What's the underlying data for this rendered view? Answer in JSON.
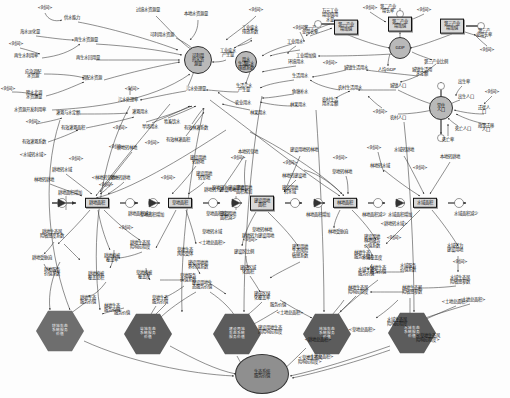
{
  "diagram": {
    "type": "system-dynamics-stock-flow",
    "colors": {
      "stock_fill": "#d8d8d8",
      "hex_fill": "#6e6e6e",
      "circle_fill": "#b9b9b9",
      "ellipse_fill": "#8f8f8f",
      "link": "#333333",
      "background": "#fdfdfd"
    }
  },
  "stocks": [
    {
      "id": "s1",
      "label": "可利用\n的水资\n源量",
      "shape": "circle",
      "x": 198,
      "y": 60,
      "w": 26,
      "h": 26
    },
    {
      "id": "s2",
      "label": "用水\n量",
      "shape": "circle",
      "x": 246,
      "y": 62,
      "w": 20,
      "h": 20
    },
    {
      "id": "s3",
      "label": "第一产业\n增加值",
      "shape": "box",
      "x": 346,
      "y": 27,
      "w": 34,
      "h": 15
    },
    {
      "id": "s4",
      "label": "第二产业\n增加值",
      "shape": "box",
      "x": 400,
      "y": 24,
      "w": 34,
      "h": 15
    },
    {
      "id": "s5",
      "label": "第三产业\n增加值",
      "shape": "box",
      "x": 452,
      "y": 26,
      "w": 34,
      "h": 15
    },
    {
      "id": "s6",
      "label": "GDP",
      "shape": "circle",
      "x": 400,
      "y": 48,
      "w": 20,
      "h": 20
    },
    {
      "id": "s7",
      "label": "常住\n人口",
      "shape": "circle",
      "x": 441,
      "y": 108,
      "w": 22,
      "h": 22
    },
    {
      "id": "s8",
      "label": "耕地面积",
      "shape": "box",
      "x": 97,
      "y": 203,
      "w": 40,
      "h": 13
    },
    {
      "id": "s9",
      "label": "草地面积",
      "shape": "box",
      "x": 180,
      "y": 203,
      "w": 40,
      "h": 13
    },
    {
      "id": "s10",
      "label": "建设用地\n面积",
      "shape": "box",
      "x": 262,
      "y": 203,
      "w": 40,
      "h": 15
    },
    {
      "id": "s11",
      "label": "林地面积",
      "shape": "box",
      "x": 345,
      "y": 203,
      "w": 40,
      "h": 13
    },
    {
      "id": "s12",
      "label": "水域面积",
      "shape": "box",
      "x": 425,
      "y": 203,
      "w": 40,
      "h": 13
    }
  ],
  "hex_nodes": [
    {
      "id": "h1",
      "label": "耕地生态\n系统服务\n价值",
      "x": 60,
      "y": 331,
      "w": 48,
      "h": 42
    },
    {
      "id": "h2",
      "label": "草地生态\n系统服务\n价值",
      "x": 148,
      "y": 334,
      "w": 48,
      "h": 42
    },
    {
      "id": "h3",
      "label": "建设用地\n生态系统\n服务价值",
      "x": 237,
      "y": 334,
      "w": 48,
      "h": 42
    },
    {
      "id": "h4",
      "label": "林地生态\n系统服务\n价值",
      "x": 327,
      "y": 334,
      "w": 48,
      "h": 42
    },
    {
      "id": "h5",
      "label": "水域生态\n系统服务\n价值",
      "x": 412,
      "y": 333,
      "w": 48,
      "h": 42
    }
  ],
  "outcome": {
    "id": "o1",
    "label": "生态系统\n服务价值",
    "x": 262,
    "y": 374,
    "w": 52,
    "h": 38
  },
  "aux_labels": [
    {
      "t": "<时间>",
      "x": 45,
      "y": 8
    },
    {
      "t": "供水能力",
      "x": 72,
      "y": 18
    },
    {
      "t": "海水淡化量",
      "x": 30,
      "y": 32
    },
    {
      "t": "<时间>",
      "x": 16,
      "y": 44
    },
    {
      "t": "再生水利用率",
      "x": 26,
      "y": 56
    },
    {
      "t": "再生水资源量",
      "x": 86,
      "y": 40
    },
    {
      "t": "再生水回用量",
      "x": 88,
      "y": 58
    },
    {
      "t": "应急调配\n水资源",
      "x": 33,
      "y": 74
    },
    {
      "t": "<时间>",
      "x": 8,
      "y": 89
    },
    {
      "t": "调配水资源",
      "x": 92,
      "y": 78
    },
    {
      "t": "跨水北调\n水资源量",
      "x": 34,
      "y": 95
    },
    {
      "t": "水资源开发利用率",
      "x": 30,
      "y": 110
    },
    {
      "t": "过境水资源量",
      "x": 148,
      "y": 10
    },
    {
      "t": "本地水资源量",
      "x": 196,
      "y": 14
    },
    {
      "t": "<时间>",
      "x": 256,
      "y": 10
    },
    {
      "t": "可利用水资源",
      "x": 162,
      "y": 35
    },
    {
      "t": "工业废水\n排放系数",
      "x": 250,
      "y": 30
    },
    {
      "t": "工业废水\n产生量",
      "x": 228,
      "y": 53
    },
    {
      "t": "生活污水\n排放系数",
      "x": 246,
      "y": 66
    },
    {
      "t": "生活污水\n产生量",
      "x": 244,
      "y": 88
    },
    {
      "t": "污水处理量",
      "x": 196,
      "y": 89
    },
    {
      "t": "污水处理率",
      "x": 128,
      "y": 100
    },
    {
      "t": "<时间>",
      "x": 132,
      "y": 89
    },
    {
      "t": "万元工业\n增加值用\n水量",
      "x": 330,
      "y": 16
    },
    {
      "t": "工业用水",
      "x": 295,
      "y": 42
    },
    {
      "t": "<时间>",
      "x": 300,
      "y": 28
    },
    {
      "t": "环境用水",
      "x": 296,
      "y": 62
    },
    {
      "t": "<时间>",
      "x": 330,
      "y": 63
    },
    {
      "t": "生活用水",
      "x": 300,
      "y": 76
    },
    {
      "t": "农业用水",
      "x": 243,
      "y": 103
    },
    {
      "t": "鱼塘补水",
      "x": 300,
      "y": 92
    },
    {
      "t": "林果用水",
      "x": 298,
      "y": 105
    },
    {
      "t": "城镇生活用\n水定额",
      "x": 422,
      "y": 72
    },
    {
      "t": "城镇生活用水",
      "x": 356,
      "y": 68
    },
    {
      "t": "农村生活用水",
      "x": 350,
      "y": 88
    },
    {
      "t": "农村生活\n用水定额",
      "x": 330,
      "y": 102
    },
    {
      "t": "<时间>",
      "x": 380,
      "y": 112
    },
    {
      "t": "城镇人口",
      "x": 398,
      "y": 86
    },
    {
      "t": "农村人口",
      "x": 398,
      "y": 118
    },
    {
      "t": "人均GDP",
      "x": 387,
      "y": 70
    },
    {
      "t": "第三产业比例",
      "x": 436,
      "y": 62
    },
    {
      "t": "出生率",
      "x": 464,
      "y": 82
    },
    {
      "t": "出生人口",
      "x": 466,
      "y": 97
    },
    {
      "t": "<时间>",
      "x": 492,
      "y": 92
    },
    {
      "t": "迁徙人\n口",
      "x": 484,
      "y": 110
    },
    {
      "t": "死亡人口",
      "x": 463,
      "y": 129
    },
    {
      "t": "死亡率",
      "x": 448,
      "y": 140
    },
    {
      "t": "政策迁移\n人口",
      "x": 486,
      "y": 128
    },
    {
      "t": "第一产\n业增长率",
      "x": 310,
      "y": 30
    },
    {
      "t": "第二产业\n增长率",
      "x": 388,
      "y": 9
    },
    {
      "t": "<时间>",
      "x": 424,
      "y": 10
    },
    {
      "t": "<时间>",
      "x": 370,
      "y": 8
    },
    {
      "t": "第三产\n业增长率",
      "x": 484,
      "y": 33
    },
    {
      "t": "<时间>",
      "x": 487,
      "y": 50
    },
    {
      "t": "工业增加值",
      "x": 306,
      "y": 56
    },
    {
      "t": "灌溉与水定额",
      "x": 68,
      "y": 113
    },
    {
      "t": "<时间>",
      "x": 33,
      "y": 122
    },
    {
      "t": "灌溉用水",
      "x": 140,
      "y": 112
    },
    {
      "t": "有效灌溉面积",
      "x": 73,
      "y": 128
    },
    {
      "t": "<时间>",
      "x": 120,
      "y": 128
    },
    {
      "t": "旱场用水",
      "x": 150,
      "y": 127
    },
    {
      "t": "有效灌溉系数",
      "x": 34,
      "y": 142
    },
    {
      "t": "<时间>",
      "x": 116,
      "y": 147
    },
    {
      "t": "牲畜饮水",
      "x": 172,
      "y": 122
    },
    {
      "t": "有效林灌系数",
      "x": 196,
      "y": 128
    },
    {
      "t": "有效林灌面积",
      "x": 178,
      "y": 140
    },
    {
      "t": "林果用水",
      "x": 258,
      "y": 113
    },
    {
      "t": "<水域转水域>",
      "x": 33,
      "y": 155
    },
    {
      "t": "耕地转林地",
      "x": 127,
      "y": 148
    },
    {
      "t": "<时间>",
      "x": 152,
      "y": 143
    },
    {
      "t": "耕地转水域",
      "x": 62,
      "y": 170
    },
    {
      "t": "<时间>",
      "x": 76,
      "y": 159
    },
    {
      "t": "本地转草地",
      "x": 248,
      "y": 152
    },
    {
      "t": "林地转耕地",
      "x": 44,
      "y": 180
    },
    {
      "t": "<林地转草地>",
      "x": 105,
      "y": 178
    },
    {
      "t": "建设用地\n转耕地",
      "x": 198,
      "y": 160
    },
    {
      "t": "<时间>",
      "x": 238,
      "y": 158
    },
    {
      "t": "<时间>",
      "x": 106,
      "y": 185
    },
    {
      "t": "草地转耕地",
      "x": 120,
      "y": 178
    },
    {
      "t": "<时间>",
      "x": 168,
      "y": 178
    },
    {
      "t": "建设用地\n转草地",
      "x": 204,
      "y": 176
    },
    {
      "t": "原地转为建设用地",
      "x": 228,
      "y": 188
    },
    {
      "t": "<时间>",
      "x": 290,
      "y": 163
    },
    {
      "t": "林地转建设地",
      "x": 294,
      "y": 176
    },
    {
      "t": "建设用地转林地",
      "x": 304,
      "y": 150
    },
    {
      "t": "<时间>",
      "x": 340,
      "y": 158
    },
    {
      "t": "草地转林地",
      "x": 342,
      "y": 172
    },
    {
      "t": "建设用地\n转水域",
      "x": 290,
      "y": 190
    },
    {
      "t": "<时间>",
      "x": 374,
      "y": 148
    },
    {
      "t": "林地转水域",
      "x": 380,
      "y": 166
    },
    {
      "t": "水域转耕地",
      "x": 404,
      "y": 150
    },
    {
      "t": "<时间>",
      "x": 420,
      "y": 168
    },
    {
      "t": "本地转耕地",
      "x": 450,
      "y": 157
    },
    {
      "t": "耕地面积增加",
      "x": 70,
      "y": 193
    },
    {
      "t": "耕地面积减少",
      "x": 140,
      "y": 214
    },
    {
      "t": "草地面积增加",
      "x": 152,
      "y": 215
    },
    {
      "t": "草地面积减少",
      "x": 218,
      "y": 214
    },
    {
      "t": "建设用地\n面积减少",
      "x": 228,
      "y": 216
    },
    {
      "t": "建设用地\n面积增加",
      "x": 244,
      "y": 190
    },
    {
      "t": "林地面积增加",
      "x": 318,
      "y": 215
    },
    {
      "t": "林地面积减少",
      "x": 374,
      "y": 215
    },
    {
      "t": "水域面积增加",
      "x": 400,
      "y": 215
    },
    {
      "t": "水域面积减少",
      "x": 466,
      "y": 214
    },
    {
      "t": "<耕地转水域>",
      "x": 394,
      "y": 224
    },
    {
      "t": "<时间>",
      "x": 126,
      "y": 228
    },
    {
      "t": "耕地转为建设用地",
      "x": 220,
      "y": 190
    },
    {
      "t": "耕地生态风\n险敏感度系数",
      "x": 52,
      "y": 234
    },
    {
      "t": "耕地转为建设用地",
      "x": 258,
      "y": 236
    },
    {
      "t": "耕地生态风\n险响应程度",
      "x": 140,
      "y": 245
    },
    {
      "t": "耕地受胁迫",
      "x": 42,
      "y": 258
    },
    {
      "t": "耕地植被\n覆盖率",
      "x": 112,
      "y": 258
    },
    {
      "t": "草地生态\n风险受体",
      "x": 185,
      "y": 252
    },
    {
      "t": "耕地服务\n价值系数",
      "x": 52,
      "y": 272
    },
    {
      "t": "耕地植被\n覆盖总积",
      "x": 96,
      "y": 276
    },
    {
      "t": "草地植被\n覆盖度",
      "x": 144,
      "y": 275
    },
    {
      "t": "草地服务\n价值系数",
      "x": 188,
      "y": 278
    },
    {
      "t": "耕地生态\n服务价值",
      "x": 88,
      "y": 300
    },
    {
      "t": "草地转水域",
      "x": 212,
      "y": 232
    },
    {
      "t": "草地转林地",
      "x": 262,
      "y": 230
    },
    {
      "t": "林地受胁迫",
      "x": 338,
      "y": 232
    },
    {
      "t": "<土地总面积>",
      "x": 212,
      "y": 243
    },
    {
      "t": "<时间>",
      "x": 250,
      "y": 240
    },
    {
      "t": "建设区比例",
      "x": 244,
      "y": 252
    },
    {
      "t": "建设用地\n生态风险\n敏感系数",
      "x": 300,
      "y": 252
    },
    {
      "t": "林地生态\n服务价值",
      "x": 362,
      "y": 255
    },
    {
      "t": "建设用地地\n界价值系数",
      "x": 198,
      "y": 265
    },
    {
      "t": "建成区域\n化面积",
      "x": 248,
      "y": 270
    },
    {
      "t": "林地生态\n服务价值",
      "x": 378,
      "y": 270
    },
    {
      "t": "建设用地生\n态服务价值",
      "x": 202,
      "y": 285
    },
    {
      "t": "草地生态\n服务价值",
      "x": 160,
      "y": 300
    },
    {
      "t": "建成区绿\n化覆盖率",
      "x": 262,
      "y": 296
    },
    {
      "t": "建设用地\n林地服务\n价值系数",
      "x": 372,
      "y": 242
    },
    {
      "t": "<时间>",
      "x": 394,
      "y": 238
    },
    {
      "t": "水域覆盖度",
      "x": 372,
      "y": 258
    },
    {
      "t": "水域生态\n服务价值",
      "x": 366,
      "y": 272
    },
    {
      "t": "水域服务\n价值系数",
      "x": 408,
      "y": 268
    },
    {
      "t": "水域转为\n建设用地",
      "x": 455,
      "y": 248
    },
    {
      "t": "<时间>",
      "x": 460,
      "y": 262
    },
    {
      "t": "水域生态风\n险敏感参数",
      "x": 460,
      "y": 280
    },
    {
      "t": "林地生态风\n险响应程度",
      "x": 358,
      "y": 290
    },
    {
      "t": "林地生态风\n险敏感参数",
      "x": 412,
      "y": 290
    },
    {
      "t": "<土地总面积>",
      "x": 472,
      "y": 300
    },
    {
      "t": "<土地总面积>",
      "x": 455,
      "y": 302
    },
    {
      "t": "林地生态\n服务价值",
      "x": 112,
      "y": 308
    },
    {
      "t": "服务价值",
      "x": 122,
      "y": 313
    },
    {
      "t": "服务价值",
      "x": 278,
      "y": 305
    },
    {
      "t": "<土地总面积>",
      "x": 290,
      "y": 313
    },
    {
      "t": "建设用地生态\n风险响应程度",
      "x": 270,
      "y": 330
    },
    {
      "t": "水域生态风\n险响应程度",
      "x": 397,
      "y": 322
    },
    {
      "t": "<草地总面积>",
      "x": 362,
      "y": 330
    },
    {
      "t": "<耕地总面积>",
      "x": 318,
      "y": 340
    },
    {
      "t": "<土地总面积>",
      "x": 320,
      "y": 357
    },
    {
      "t": "<草地生态风\n险响应程度>",
      "x": 428,
      "y": 338
    },
    {
      "t": "<草地生态风\n险响应程度>",
      "x": 310,
      "y": 360
    }
  ]
}
